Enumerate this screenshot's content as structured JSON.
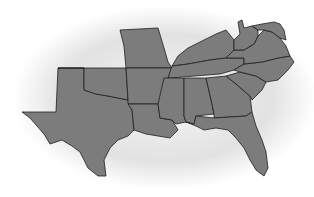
{
  "map": {
    "subject": "Southern United States",
    "colors": {
      "background": "#ffffff",
      "ellipse_center": "#f4f4f4",
      "ellipse_edge": "#c8c8c8",
      "state_fill": "#7c7c7c",
      "state_border": "#1e1e1e"
    },
    "states": [
      {
        "id": "texas",
        "name": "Texas",
        "path": "M58,68 L84,68 L84,90 L96,94 L108,96 L118,98 L128,100 L132,110 L134,130 L128,136 L118,140 L110,148 L104,160 L106,176 L98,176 L88,168 L80,152 L72,146 L62,140 L50,144 L44,134 L30,118 L22,112 L56,112 Z"
      },
      {
        "id": "oklahoma",
        "name": "Oklahoma",
        "path": "M58,68 L126,68 L128,100 L118,98 L108,96 L96,94 L84,90 L84,68 Z"
      },
      {
        "id": "missouri",
        "name": "Missouri",
        "path": "M120,30 L158,28 L164,48 L168,62 L172,68 L126,68 L124,46 Z"
      },
      {
        "id": "arkansas",
        "name": "Arkansas",
        "path": "M126,68 L172,68 L168,78 L164,92 L158,104 L128,104 L128,100 Z"
      },
      {
        "id": "louisiana",
        "name": "Louisiana",
        "path": "M128,104 L158,104 L160,118 L172,120 L178,130 L170,138 L158,136 L146,134 L134,130 L132,110 Z"
      },
      {
        "id": "kentucky",
        "name": "Kentucky",
        "path": "M172,66 L178,56 L188,48 L204,40 L216,34 L226,30 L234,40 L234,50 L226,58 L210,60 L188,64 Z"
      },
      {
        "id": "tennessee",
        "name": "Tennessee",
        "path": "M168,78 L172,66 L188,64 L210,60 L226,58 L244,58 L244,64 L234,70 L220,74 L170,78 Z"
      },
      {
        "id": "mississippi",
        "name": "Mississippi",
        "path": "M164,78 L184,78 L184,116 L186,122 L176,124 L172,120 L160,118 L158,104 Z"
      },
      {
        "id": "alabama",
        "name": "Alabama",
        "path": "M184,78 L206,78 L212,104 L214,114 L196,116 L194,124 L186,122 L184,116 Z"
      },
      {
        "id": "georgia",
        "name": "Georgia",
        "path": "M206,78 L226,76 L236,84 L250,96 L252,112 L246,116 L214,118 L214,114 L212,104 Z"
      },
      {
        "id": "florida",
        "name": "Florida",
        "path": "M186,122 L194,124 L196,116 L214,118 L246,116 L252,112 L256,126 L262,140 L266,152 L268,168 L264,176 L256,170 L250,160 L244,148 L236,138 L228,130 L216,128 L204,130 L196,126 Z"
      },
      {
        "id": "south-carolina",
        "name": "South Carolina",
        "path": "M226,76 L240,72 L256,76 L266,82 L262,90 L252,100 L250,96 L236,84 Z"
      },
      {
        "id": "north-carolina",
        "name": "North Carolina",
        "path": "M234,70 L244,64 L262,62 L278,58 L290,56 L294,62 L288,70 L278,80 L266,82 L256,76 L240,72 Z"
      },
      {
        "id": "virginia",
        "name": "Virginia",
        "path": "M226,58 L234,50 L244,50 L254,44 L258,36 L264,30 L272,32 L280,38 L286,46 L290,56 L278,58 L262,62 L244,64 L244,58 Z"
      },
      {
        "id": "west-virginia",
        "name": "West Virginia",
        "path": "M234,40 L240,34 L238,22 L242,20 L244,28 L252,26 L258,30 L258,36 L254,44 L244,50 L234,50 Z"
      },
      {
        "id": "maryland-delaware",
        "name": "Maryland / Delaware",
        "path": "M252,26 L262,24 L274,22 L280,24 L284,30 L286,40 L280,38 L272,32 L264,30 L258,30 Z"
      }
    ]
  }
}
